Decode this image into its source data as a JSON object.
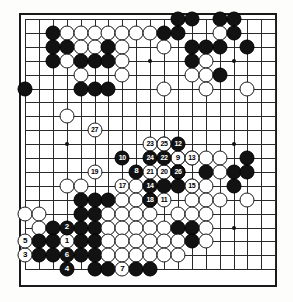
{
  "diagram": {
    "type": "go-game-record",
    "board_size": 19,
    "colors": {
      "black_stone": "#121212",
      "white_stone": "#ffffff",
      "grid_line": "#2a2a2a",
      "board_background": "#ffffff",
      "border": "#1a1a1a"
    },
    "geometry": {
      "origin_x": 25,
      "origin_y": 19,
      "spacing": 13.9,
      "stone_diameter": 15
    },
    "hoshi": [
      {
        "col": 3,
        "row": 3
      },
      {
        "col": 9,
        "row": 3
      },
      {
        "col": 15,
        "row": 3
      },
      {
        "col": 3,
        "row": 9
      },
      {
        "col": 9,
        "row": 9
      },
      {
        "col": 15,
        "row": 9
      },
      {
        "col": 3,
        "row": 15
      },
      {
        "col": 9,
        "row": 15
      },
      {
        "col": 15,
        "row": 15
      }
    ],
    "stones": [
      {
        "col": 12,
        "row": 1,
        "color": "black"
      },
      {
        "col": 13,
        "row": 1,
        "color": "black"
      },
      {
        "col": 15,
        "row": 1,
        "color": "black"
      },
      {
        "col": 16,
        "row": 1,
        "color": "black"
      },
      {
        "col": 3,
        "row": 2,
        "color": "black"
      },
      {
        "col": 4,
        "row": 2,
        "color": "white"
      },
      {
        "col": 5,
        "row": 2,
        "color": "white"
      },
      {
        "col": 6,
        "row": 2,
        "color": "white"
      },
      {
        "col": 7,
        "row": 2,
        "color": "white"
      },
      {
        "col": 8,
        "row": 2,
        "color": "white"
      },
      {
        "col": 9,
        "row": 2,
        "color": "white"
      },
      {
        "col": 10,
        "row": 2,
        "color": "white"
      },
      {
        "col": 11,
        "row": 2,
        "color": "black"
      },
      {
        "col": 12,
        "row": 2,
        "color": "black"
      },
      {
        "col": 15,
        "row": 2,
        "color": "white"
      },
      {
        "col": 16,
        "row": 2,
        "color": "black"
      },
      {
        "col": 3,
        "row": 3,
        "color": "black"
      },
      {
        "col": 4,
        "row": 3,
        "color": "black"
      },
      {
        "col": 5,
        "row": 3,
        "color": "white"
      },
      {
        "col": 6,
        "row": 3,
        "color": "white"
      },
      {
        "col": 7,
        "row": 3,
        "color": "black"
      },
      {
        "col": 8,
        "row": 3,
        "color": "white"
      },
      {
        "col": 11,
        "row": 3,
        "color": "white"
      },
      {
        "col": 13,
        "row": 3,
        "color": "black"
      },
      {
        "col": 14,
        "row": 3,
        "color": "black"
      },
      {
        "col": 15,
        "row": 3,
        "color": "black"
      },
      {
        "col": 17,
        "row": 3,
        "color": "black"
      },
      {
        "col": 3,
        "row": 4,
        "color": "black"
      },
      {
        "col": 4,
        "row": 4,
        "color": "white"
      },
      {
        "col": 5,
        "row": 4,
        "color": "black"
      },
      {
        "col": 6,
        "row": 4,
        "color": "black"
      },
      {
        "col": 7,
        "row": 4,
        "color": "black"
      },
      {
        "col": 8,
        "row": 4,
        "color": "white"
      },
      {
        "col": 13,
        "row": 4,
        "color": "black"
      },
      {
        "col": 14,
        "row": 4,
        "color": "white"
      },
      {
        "col": 5,
        "row": 5,
        "color": "white"
      },
      {
        "col": 8,
        "row": 5,
        "color": "white"
      },
      {
        "col": 13,
        "row": 5,
        "color": "white"
      },
      {
        "col": 14,
        "row": 5,
        "color": "white"
      },
      {
        "col": 15,
        "row": 5,
        "color": "black"
      },
      {
        "col": 1,
        "row": 6,
        "color": "black"
      },
      {
        "col": 5,
        "row": 6,
        "color": "black"
      },
      {
        "col": 6,
        "row": 6,
        "color": "black"
      },
      {
        "col": 7,
        "row": 6,
        "color": "black"
      },
      {
        "col": 11,
        "row": 6,
        "color": "white"
      },
      {
        "col": 14,
        "row": 6,
        "color": "white"
      },
      {
        "col": 17,
        "row": 6,
        "color": "white"
      },
      {
        "col": 4,
        "row": 8,
        "color": "white"
      },
      {
        "col": 12,
        "row": 11,
        "color": "white"
      },
      {
        "col": 13,
        "row": 11,
        "color": "white"
      },
      {
        "col": 14,
        "row": 11,
        "color": "white"
      },
      {
        "col": 15,
        "row": 11,
        "color": "white"
      },
      {
        "col": 17,
        "row": 11,
        "color": "black"
      },
      {
        "col": 11,
        "row": 12,
        "color": "black"
      },
      {
        "col": 12,
        "row": 12,
        "color": "black"
      },
      {
        "col": 14,
        "row": 12,
        "color": "black"
      },
      {
        "col": 15,
        "row": 12,
        "color": "white"
      },
      {
        "col": 16,
        "row": 12,
        "color": "black"
      },
      {
        "col": 17,
        "row": 12,
        "color": "black"
      },
      {
        "col": 4,
        "row": 13,
        "color": "white"
      },
      {
        "col": 5,
        "row": 13,
        "color": "white"
      },
      {
        "col": 9,
        "row": 13,
        "color": "white"
      },
      {
        "col": 11,
        "row": 13,
        "color": "black"
      },
      {
        "col": 12,
        "row": 13,
        "color": "black"
      },
      {
        "col": 13,
        "row": 13,
        "color": "white"
      },
      {
        "col": 14,
        "row": 13,
        "color": "white"
      },
      {
        "col": 16,
        "row": 13,
        "color": "black"
      },
      {
        "col": 5,
        "row": 14,
        "color": "black"
      },
      {
        "col": 6,
        "row": 14,
        "color": "black"
      },
      {
        "col": 7,
        "row": 14,
        "color": "black"
      },
      {
        "col": 8,
        "row": 14,
        "color": "white"
      },
      {
        "col": 9,
        "row": 14,
        "color": "white"
      },
      {
        "col": 10,
        "row": 14,
        "color": "white"
      },
      {
        "col": 13,
        "row": 14,
        "color": "white"
      },
      {
        "col": 14,
        "row": 14,
        "color": "white"
      },
      {
        "col": 15,
        "row": 14,
        "color": "white"
      },
      {
        "col": 17,
        "row": 14,
        "color": "white"
      },
      {
        "col": 1,
        "row": 15,
        "color": "white"
      },
      {
        "col": 2,
        "row": 15,
        "color": "white"
      },
      {
        "col": 5,
        "row": 15,
        "color": "black"
      },
      {
        "col": 6,
        "row": 15,
        "color": "black"
      },
      {
        "col": 7,
        "row": 15,
        "color": "white"
      },
      {
        "col": 8,
        "row": 15,
        "color": "white"
      },
      {
        "col": 9,
        "row": 15,
        "color": "white"
      },
      {
        "col": 10,
        "row": 15,
        "color": "white"
      },
      {
        "col": 12,
        "row": 15,
        "color": "white"
      },
      {
        "col": 13,
        "row": 15,
        "color": "white"
      },
      {
        "col": 14,
        "row": 15,
        "color": "white"
      },
      {
        "col": 2,
        "row": 16,
        "color": "white"
      },
      {
        "col": 3,
        "row": 16,
        "color": "black"
      },
      {
        "col": 5,
        "row": 16,
        "color": "black"
      },
      {
        "col": 6,
        "row": 16,
        "color": "black"
      },
      {
        "col": 7,
        "row": 16,
        "color": "white"
      },
      {
        "col": 8,
        "row": 16,
        "color": "white"
      },
      {
        "col": 9,
        "row": 16,
        "color": "white"
      },
      {
        "col": 10,
        "row": 16,
        "color": "white"
      },
      {
        "col": 11,
        "row": 16,
        "color": "white"
      },
      {
        "col": 12,
        "row": 16,
        "color": "black"
      },
      {
        "col": 13,
        "row": 16,
        "color": "black"
      },
      {
        "col": 14,
        "row": 16,
        "color": "white"
      },
      {
        "col": 2,
        "row": 17,
        "color": "black"
      },
      {
        "col": 3,
        "row": 17,
        "color": "black"
      },
      {
        "col": 5,
        "row": 17,
        "color": "black"
      },
      {
        "col": 6,
        "row": 17,
        "color": "black"
      },
      {
        "col": 7,
        "row": 17,
        "color": "white"
      },
      {
        "col": 8,
        "row": 17,
        "color": "white"
      },
      {
        "col": 9,
        "row": 17,
        "color": "white"
      },
      {
        "col": 10,
        "row": 17,
        "color": "white"
      },
      {
        "col": 11,
        "row": 17,
        "color": "white"
      },
      {
        "col": 12,
        "row": 17,
        "color": "white"
      },
      {
        "col": 13,
        "row": 17,
        "color": "black"
      },
      {
        "col": 14,
        "row": 17,
        "color": "white"
      },
      {
        "col": 2,
        "row": 18,
        "color": "black"
      },
      {
        "col": 3,
        "row": 18,
        "color": "black"
      },
      {
        "col": 5,
        "row": 18,
        "color": "black"
      },
      {
        "col": 6,
        "row": 18,
        "color": "black"
      },
      {
        "col": 7,
        "row": 18,
        "color": "white"
      },
      {
        "col": 8,
        "row": 18,
        "color": "white"
      },
      {
        "col": 9,
        "row": 18,
        "color": "white"
      },
      {
        "col": 10,
        "row": 18,
        "color": "white"
      },
      {
        "col": 11,
        "row": 18,
        "color": "white"
      },
      {
        "col": 12,
        "row": 18,
        "color": "white"
      },
      {
        "col": 6,
        "row": 19,
        "color": "black"
      },
      {
        "col": 7,
        "row": 19,
        "color": "black"
      },
      {
        "col": 9,
        "row": 19,
        "color": "black"
      },
      {
        "col": 10,
        "row": 19,
        "color": "black"
      }
    ],
    "move_stones": [
      {
        "num": "1",
        "col": 4,
        "row": 17,
        "color": "white"
      },
      {
        "num": "2",
        "col": 4,
        "row": 16,
        "color": "black"
      },
      {
        "num": "3",
        "col": 1,
        "row": 18,
        "color": "white"
      },
      {
        "num": "4",
        "col": 4,
        "row": 19,
        "color": "black"
      },
      {
        "num": "5",
        "col": 1,
        "row": 17,
        "color": "white"
      },
      {
        "num": "6",
        "col": 4,
        "row": 18,
        "color": "black"
      },
      {
        "num": "7",
        "col": 8,
        "row": 19,
        "color": "white"
      },
      {
        "num": "8",
        "col": 9,
        "row": 12,
        "color": "black"
      },
      {
        "num": "9",
        "col": 12,
        "row": 11,
        "color": "white"
      },
      {
        "num": "10",
        "col": 8,
        "row": 11,
        "color": "black"
      },
      {
        "num": "11",
        "col": 11,
        "row": 14,
        "color": "white"
      },
      {
        "num": "12",
        "col": 12,
        "row": 10,
        "color": "black"
      },
      {
        "num": "13",
        "col": 13,
        "row": 11,
        "color": "white"
      },
      {
        "num": "14",
        "col": 10,
        "row": 13,
        "color": "black"
      },
      {
        "num": "15",
        "col": 13,
        "row": 13,
        "color": "white"
      },
      {
        "num": "16",
        "col": 11,
        "row": 10,
        "color": "black"
      },
      {
        "num": "17",
        "col": 8,
        "row": 13,
        "color": "white"
      },
      {
        "num": "18",
        "col": 10,
        "row": 14,
        "color": "black"
      },
      {
        "num": "19",
        "col": 6,
        "row": 12,
        "color": "white"
      },
      {
        "num": "20",
        "col": 11,
        "row": 12,
        "color": "white"
      },
      {
        "num": "21",
        "col": 10,
        "row": 12,
        "color": "white"
      },
      {
        "num": "22",
        "col": 11,
        "row": 11,
        "color": "black"
      },
      {
        "num": "23",
        "col": 10,
        "row": 10,
        "color": "white"
      },
      {
        "num": "24",
        "col": 10,
        "row": 11,
        "color": "black"
      },
      {
        "num": "25",
        "col": 11,
        "row": 10,
        "color": "white"
      },
      {
        "num": "26",
        "col": 12,
        "row": 12,
        "color": "black"
      },
      {
        "num": "27",
        "col": 6,
        "row": 9,
        "color": "white"
      }
    ]
  }
}
